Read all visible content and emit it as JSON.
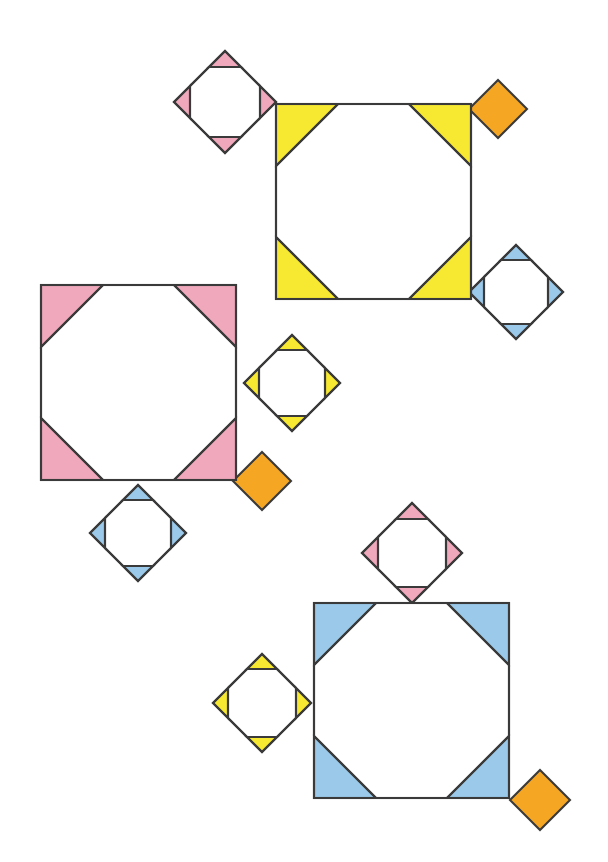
{
  "figure": {
    "canvas": {
      "width": 608,
      "height": 862,
      "background": "#ffffff"
    },
    "palette": {
      "yellow": "#F7E832",
      "pink": "#F0A8BC",
      "blue": "#9BC9EA",
      "orange": "#F5A623",
      "white": "#FFFFFF",
      "stroke": "#3A3A3A"
    },
    "stroke_width": 2.1,
    "shape_kinds": {
      "big_square": "square with four shaded right-triangle corners leaving a white octagon center",
      "small_diamond": "45-degree rotated square with four shaded right-triangle corners leaving a white octagon center",
      "solid_diamond": "45-degree rotated square, fully shaded, no cutout"
    },
    "groups": [
      {
        "name": "yellow-group",
        "big_square": {
          "id": "big-square-yellow",
          "color_key": "yellow",
          "x": 276,
          "y": 104,
          "size": 195,
          "corner": 62
        },
        "satellites": [
          {
            "id": "diamond-pink-top-left",
            "kind": "small_diamond",
            "color_key": "pink",
            "cx": 225,
            "cy": 102,
            "half": 51,
            "corner": 16
          },
          {
            "id": "diamond-orange-top-right",
            "kind": "solid_diamond",
            "color_key": "orange",
            "cx": 498,
            "cy": 109,
            "half": 29
          },
          {
            "id": "diamond-blue-right",
            "kind": "small_diamond",
            "color_key": "blue",
            "cx": 516,
            "cy": 292,
            "half": 47,
            "corner": 15
          }
        ]
      },
      {
        "name": "pink-group",
        "big_square": {
          "id": "big-square-pink",
          "color_key": "pink",
          "x": 41,
          "y": 285,
          "size": 195,
          "corner": 62
        },
        "satellites": [
          {
            "id": "diamond-yellow-right",
            "kind": "small_diamond",
            "color_key": "yellow",
            "cx": 292,
            "cy": 383,
            "half": 48,
            "corner": 15
          },
          {
            "id": "diamond-orange-lower-right",
            "kind": "solid_diamond",
            "color_key": "orange",
            "cx": 262,
            "cy": 481,
            "half": 29
          },
          {
            "id": "diamond-blue-below",
            "kind": "small_diamond",
            "color_key": "blue",
            "cx": 138,
            "cy": 533,
            "half": 48,
            "corner": 15
          }
        ]
      },
      {
        "name": "blue-group",
        "big_square": {
          "id": "big-square-blue",
          "color_key": "blue",
          "x": 314,
          "y": 603,
          "size": 195,
          "corner": 62
        },
        "satellites": [
          {
            "id": "diamond-pink-above",
            "kind": "small_diamond",
            "color_key": "pink",
            "cx": 412,
            "cy": 553,
            "half": 50,
            "corner": 16
          },
          {
            "id": "diamond-yellow-left",
            "kind": "small_diamond",
            "color_key": "yellow",
            "cx": 262,
            "cy": 703,
            "half": 49,
            "corner": 15
          },
          {
            "id": "diamond-orange-bottom-right",
            "kind": "solid_diamond",
            "color_key": "orange",
            "cx": 540,
            "cy": 800,
            "half": 30
          }
        ]
      }
    ]
  }
}
